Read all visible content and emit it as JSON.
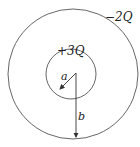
{
  "diagram": {
    "type": "concentric-spherical-shells",
    "outer_shell": {
      "charge_label": "−2Q",
      "radius_label": "b"
    },
    "inner_shell": {
      "charge_label": "+3Q",
      "radius_label": "a"
    },
    "colors": {
      "line": "#444444",
      "background": "#ffffff"
    }
  }
}
